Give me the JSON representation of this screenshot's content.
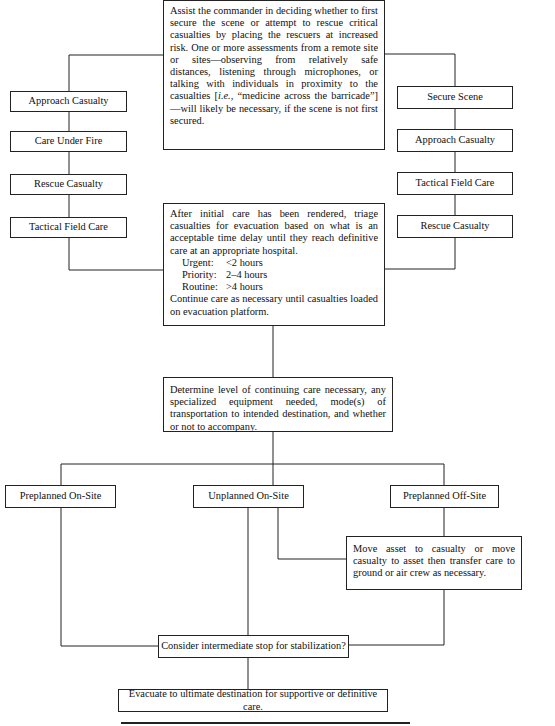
{
  "top_box": {
    "text": "Assist the commander in deciding whether to first secure the scene or attempt to rescue critical casualties by placing the rescuers at increased risk.  One or more assessments from a remote site or sites—observing from relatively safe distances, listening through microphones, or talking with individuals in proximity to the casualties [",
    "italic": "i.e.,",
    "text_after": " “medicine across the barricade”]—will likely be necessary, if the scene is not first secured."
  },
  "left_column": {
    "items": [
      {
        "label": "Approach Casualty"
      },
      {
        "label": "Care Under Fire"
      },
      {
        "label": "Rescue Casualty"
      },
      {
        "label": "Tactical Field Care"
      }
    ]
  },
  "right_column": {
    "items": [
      {
        "label": "Secure Scene"
      },
      {
        "label": "Approach Casualty"
      },
      {
        "label": "Tactical Field Care"
      },
      {
        "label": "Rescue Casualty"
      }
    ]
  },
  "triage_box": {
    "intro": "After initial care has been rendered, triage casualties for evacuation based on what is an acceptable time delay until they reach definitive care at an appropriate hospital.",
    "priorities": [
      {
        "name": "Urgent:",
        "time": "<2 hours"
      },
      {
        "name": "Priority:",
        "time": "2–4 hours"
      },
      {
        "name": "Routine:",
        "time": ">4 hours"
      }
    ],
    "outro": "Continue care as necessary until casualties loaded on evacuation platform."
  },
  "determine_box": {
    "text": "Determine level of continuing care necessary, any specialized equipment needed, mode(s) of transportation to intended destination, and whether or not to accompany."
  },
  "options": {
    "items": [
      {
        "label": "Preplanned On-Site"
      },
      {
        "label": "Unplanned On-Site"
      },
      {
        "label": "Preplanned Off-Site"
      }
    ]
  },
  "move_asset_box": {
    "text": "Move asset to casualty or move casualty to asset then transfer care to ground or air crew as necessary."
  },
  "consider_box": {
    "label": "Consider intermediate stop for stabilization?"
  },
  "evacuate_box": {
    "label": "Evacuate to ultimate destination for supportive or definitive care."
  },
  "colors": {
    "line": "#222222",
    "background": "#ffffff",
    "text": "#111111"
  }
}
